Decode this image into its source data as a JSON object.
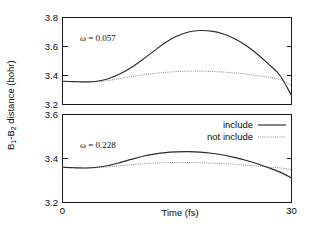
{
  "figure": {
    "ylabel": "B1-B2 distance (bohr)",
    "ylabel_parts": {
      "b": "B",
      "sub1": "1",
      "dash": "-",
      "sub2": "2",
      "rest": " distance (bohr)"
    },
    "xlabel": "Time (fs)"
  },
  "legend": {
    "position": "top-right of lower panel",
    "entries": [
      {
        "label": "include",
        "style": "solid",
        "color": "#2b2b2b"
      },
      {
        "label": "not include",
        "style": "dotted",
        "color": "#8c8c8c"
      }
    ]
  },
  "panels": {
    "top": {
      "annotation": "ω = 0.057",
      "yticks": [
        "3.2",
        "3.4",
        "3.6",
        "3.8"
      ],
      "ylim": [
        3.2,
        3.8
      ]
    },
    "bottom": {
      "annotation": "ω = 0.228",
      "yticks": [
        "3.2",
        "3.4",
        "3.6"
      ],
      "ylim": [
        3.2,
        3.6
      ]
    }
  },
  "xaxis": {
    "ticks": [
      "0",
      "30"
    ],
    "xlim": [
      0,
      30
    ],
    "label": "Time (fs)"
  },
  "chart_data": [
    {
      "type": "line",
      "id": "panel-top",
      "title": "ω = 0.057",
      "xlabel": "Time (fs)",
      "ylabel": "B1-B2 distance (bohr)",
      "xlim": [
        0,
        30
      ],
      "ylim": [
        3.2,
        3.8
      ],
      "xticks": [
        0,
        30
      ],
      "yticks": [
        3.2,
        3.4,
        3.6,
        3.8
      ],
      "grid": false,
      "legend_position": "none",
      "x": [
        0,
        1.5,
        3,
        4.5,
        6,
        7.5,
        9,
        10.5,
        12,
        13.5,
        15,
        16.5,
        18,
        19.5,
        21,
        22.5,
        24,
        25.5,
        27,
        28.5,
        30
      ],
      "series": [
        {
          "name": "include",
          "style": "solid",
          "color": "#2b2b2b",
          "values": [
            3.36,
            3.358,
            3.356,
            3.36,
            3.378,
            3.41,
            3.455,
            3.51,
            3.57,
            3.628,
            3.672,
            3.7,
            3.71,
            3.706,
            3.688,
            3.655,
            3.608,
            3.548,
            3.478,
            3.4,
            3.262
          ]
        },
        {
          "name": "not include",
          "style": "dotted",
          "color": "#8c8c8c",
          "values": [
            3.36,
            3.358,
            3.356,
            3.358,
            3.366,
            3.378,
            3.392,
            3.404,
            3.414,
            3.422,
            3.427,
            3.43,
            3.43,
            3.428,
            3.424,
            3.418,
            3.41,
            3.4,
            3.388,
            3.372,
            3.33
          ]
        }
      ]
    },
    {
      "type": "line",
      "id": "panel-bottom",
      "title": "ω = 0.228",
      "xlabel": "Time (fs)",
      "ylabel": "B1-B2 distance (bohr)",
      "xlim": [
        0,
        30
      ],
      "ylim": [
        3.2,
        3.6
      ],
      "xticks": [
        0,
        30
      ],
      "yticks": [
        3.2,
        3.4,
        3.6
      ],
      "grid": false,
      "legend_position": "top-right",
      "x": [
        0,
        1.5,
        3,
        4.5,
        6,
        7.5,
        9,
        10.5,
        12,
        13.5,
        15,
        16.5,
        18,
        19.5,
        21,
        22.5,
        24,
        25.5,
        27,
        28.5,
        30
      ],
      "series": [
        {
          "name": "include",
          "style": "solid",
          "color": "#2b2b2b",
          "values": [
            3.36,
            3.358,
            3.357,
            3.36,
            3.368,
            3.381,
            3.396,
            3.41,
            3.42,
            3.427,
            3.43,
            3.431,
            3.429,
            3.424,
            3.416,
            3.405,
            3.392,
            3.376,
            3.358,
            3.338,
            3.312
          ]
        },
        {
          "name": "not include",
          "style": "dotted",
          "color": "#8c8c8c",
          "values": [
            3.36,
            3.358,
            3.357,
            3.358,
            3.362,
            3.367,
            3.372,
            3.376,
            3.379,
            3.381,
            3.382,
            3.382,
            3.381,
            3.379,
            3.377,
            3.374,
            3.37,
            3.366,
            3.361,
            3.357,
            3.35
          ]
        }
      ]
    }
  ]
}
